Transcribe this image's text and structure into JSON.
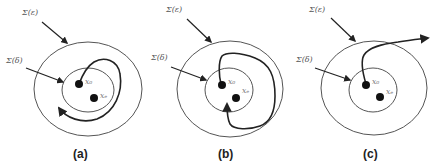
{
  "figure": {
    "panels": [
      {
        "id": "a",
        "caption": "(a)",
        "outer_label": "Σ(ε)",
        "inner_label": "Σ(δ)",
        "point_start": "x₀",
        "point_equilibrium": "xₑ",
        "behavior": "trajectory stays within Σ(ε) but does not converge"
      },
      {
        "id": "b",
        "caption": "(b)",
        "outer_label": "Σ(ε)",
        "inner_label": "Σ(δ)",
        "point_start": "x₀",
        "point_equilibrium": "xₑ",
        "behavior": "trajectory stays within Σ(ε) and converges to xₑ"
      },
      {
        "id": "c",
        "caption": "(c)",
        "outer_label": "Σ(ε)",
        "inner_label": "Σ(δ)",
        "point_start": "x₀",
        "point_equilibrium": "xₑ",
        "behavior": "trajectory leaves Σ(ε)"
      }
    ],
    "colors": {
      "ring": "#555555",
      "trajectory": "#222222",
      "point": "#111111",
      "label": "#555555"
    }
  }
}
